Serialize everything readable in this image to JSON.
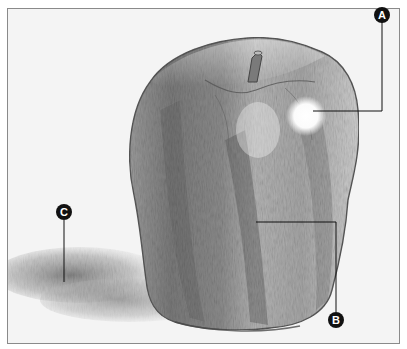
{
  "figure": {
    "background_color": "#f4f4f4",
    "border_color": "#8a8a8a",
    "callout_color": "#111111"
  },
  "callouts": [
    {
      "label": "A",
      "target": "highlight"
    },
    {
      "label": "B",
      "target": "mid-tone side"
    },
    {
      "label": "C",
      "target": "cast shadow"
    }
  ]
}
